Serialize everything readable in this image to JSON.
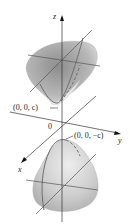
{
  "diagram": {
    "axes": {
      "z": "z",
      "y": "y",
      "x": "x",
      "origin": "0"
    },
    "labels": {
      "upper_vertex": "(0, 0, c)",
      "lower_vertex": "(0, 0, −c)"
    },
    "colors": {
      "surface_dark": "#9a9a9a",
      "surface_light": "#d6d6d6",
      "trace": "#707070",
      "axis": "#333333"
    }
  }
}
